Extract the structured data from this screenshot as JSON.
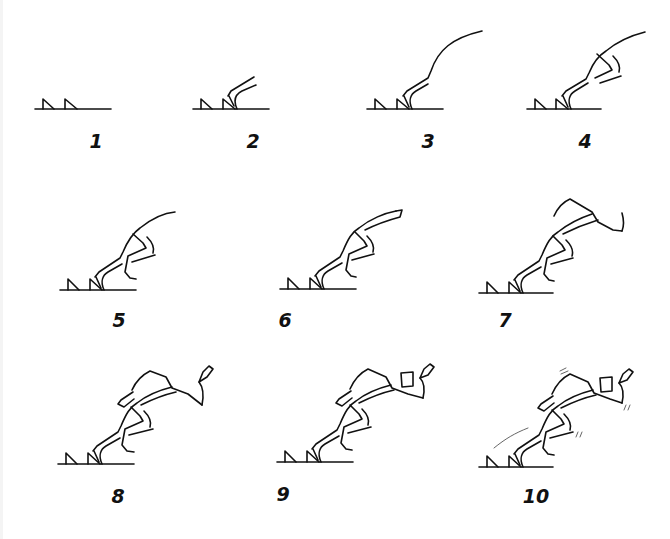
{
  "diagram": {
    "stroke_color": "#111111",
    "background": "#ffffff",
    "frames": [
      {
        "label": "1",
        "label_x": 96,
        "label_y": 132,
        "description": "Starting blocks only"
      },
      {
        "label": "2",
        "label_x": 253,
        "label_y": 132,
        "description": "Rear foot and lower leg on block"
      },
      {
        "label": "3",
        "label_x": 428,
        "label_y": 132,
        "description": "Leg line with back curve"
      },
      {
        "label": "4",
        "label_x": 585,
        "label_y": 132,
        "description": "Thigh and front knee added"
      },
      {
        "label": "5",
        "label_x": 119,
        "label_y": 311,
        "description": "Front leg and foot defined"
      },
      {
        "label": "6",
        "label_x": 285,
        "label_y": 311,
        "description": "Torso thickness added"
      },
      {
        "label": "7",
        "label_x": 505,
        "label_y": 311,
        "description": "Shoulder and arm outline"
      },
      {
        "label": "8",
        "label_x": 118,
        "label_y": 487,
        "description": "Arms with hands"
      },
      {
        "label": "9",
        "label_x": 283,
        "label_y": 485,
        "description": "Rear hand detail"
      },
      {
        "label": "10",
        "label_x": 536,
        "label_y": 487,
        "description": "Motion lines added"
      }
    ]
  }
}
